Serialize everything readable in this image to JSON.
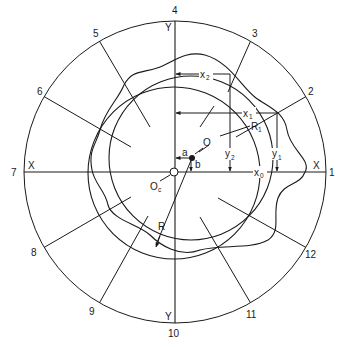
{
  "diagram": {
    "type": "roundness-measurement-polar-diagram",
    "outer_circle": {
      "cx": 175,
      "cy": 172,
      "r": 151
    },
    "axes": {
      "x_label_left": "X",
      "x_label_right": "X",
      "y_label_top": "Y",
      "y_label_bottom": "Y"
    },
    "spoke_numbers": [
      "1",
      "2",
      "3",
      "4",
      "5",
      "6",
      "7",
      "8",
      "9",
      "10",
      "11",
      "12"
    ],
    "labels": {
      "O": "O",
      "Oc": "O",
      "Oc_sub": "c",
      "a": "a",
      "b": "b",
      "R": "R",
      "R1": "R",
      "R1_sub": "1",
      "x0": "x",
      "x0_sub": "0",
      "x1": "x",
      "x1_sub": "1",
      "x2": "x",
      "x2_sub": "2",
      "y1": "y",
      "y1_sub": "1",
      "y2": "y",
      "y2_sub": "2"
    },
    "colors": {
      "line": "#1a1a1a",
      "background": "#ffffff"
    }
  }
}
